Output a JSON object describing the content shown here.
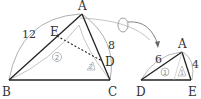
{
  "diagram": {
    "left_triangle": {
      "vertices": {
        "A": "A",
        "B": "B",
        "C": "C",
        "D": "D",
        "E": "E"
      },
      "side_labels": {
        "AB": "12",
        "AC": "8"
      },
      "angle_marks": {
        "circle": "2",
        "triangle": "2"
      }
    },
    "arrow": {
      "symbol": "O"
    },
    "right_triangle": {
      "vertices": {
        "A": "A",
        "D": "D",
        "E": "E"
      },
      "side_labels": {
        "AD": "6",
        "AE": "4"
      },
      "angle_marks": {
        "circle": "1",
        "triangle": "1"
      }
    },
    "colors": {
      "line": "#333333",
      "arc": "#999999",
      "mark": "#aaaaaa"
    }
  }
}
